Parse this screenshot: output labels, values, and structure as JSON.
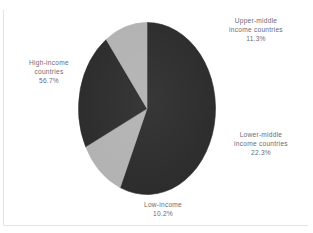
{
  "chart_data": {
    "type": "pie",
    "title": "",
    "subtitle": "",
    "xlabel": "",
    "ylabel": "",
    "legend_position": "none",
    "grid": false,
    "labels_outside": true,
    "categories": [
      "High-income countries",
      "Upper-middle income countries",
      "Lower-middle income countries",
      "Low-income"
    ],
    "values": [
      56.7,
      11.3,
      22.3,
      10.2
    ],
    "value_suffix": "%",
    "slice_colors": [
      "#2b2b2b",
      "#b2b2b2",
      "#2b2b2b",
      "#b2b2b2"
    ],
    "start_angle_deg": -90,
    "direction": "clockwise",
    "slices": [
      {
        "name": "high-income",
        "label_line1": "High-income",
        "label_line2": "countries",
        "percent_text": "56.7%",
        "value": 56.7,
        "color": "#2b2b2b"
      },
      {
        "name": "upper-middle-income",
        "label_line1": "Upper-middle",
        "label_line2": "income countries",
        "percent_text": "11.3%",
        "value": 11.3,
        "color": "#b2b2b2"
      },
      {
        "name": "lower-middle-income",
        "label_line1": "Lower-middle",
        "label_line2": "income countries",
        "percent_text": "22.3%",
        "value": 22.3,
        "color": "#2b2b2b"
      },
      {
        "name": "low-income",
        "label_line1": "Low-income",
        "label_line2": "",
        "percent_text": "10.2%",
        "value": 10.2,
        "color": "#b2b2b2"
      }
    ]
  },
  "colors": {
    "dark_slice": "#2b2b2b",
    "light_slice": "#b2b2b2",
    "label_text": "#6b6b78",
    "background": "#ffffff",
    "frame_line": "#e3e3e3"
  }
}
